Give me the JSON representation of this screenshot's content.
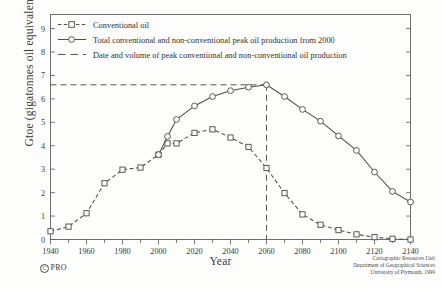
{
  "chart_data": {
    "type": "line",
    "title": "",
    "xlabel": "Year",
    "ylabel": "Gtoe (gigatonnes oil equivalent)",
    "xlim": [
      1940,
      2140
    ],
    "ylim": [
      0,
      9.6
    ],
    "xticks": [
      1940,
      1960,
      1980,
      2000,
      2020,
      2040,
      2060,
      2080,
      2100,
      2120,
      2140
    ],
    "xtick_labels": [
      "1940",
      "1960",
      "1980",
      "2000",
      "2020",
      "2040",
      "2060",
      "2080",
      "2100",
      "2120",
      "2140"
    ],
    "xminorticks": [
      1950,
      1970,
      1990,
      2010,
      2030,
      2050,
      2070,
      2090,
      2110,
      2130
    ],
    "yticks": [
      0,
      1,
      2,
      3,
      4,
      5,
      6,
      7,
      8,
      9
    ],
    "ytick_labels": [
      "0",
      "1",
      "2",
      "3",
      "4",
      "5",
      "6",
      "7",
      "8",
      "9"
    ],
    "grid": false,
    "legend_position": "upper-left-inside",
    "series": [
      {
        "name": "Conventional oil",
        "style": "dashed",
        "marker": "square",
        "x": [
          1940,
          1950,
          1960,
          1970,
          1980,
          1990,
          2000,
          2005,
          2010,
          2020,
          2030,
          2040,
          2050,
          2060,
          2070,
          2080,
          2090,
          2100,
          2110,
          2120,
          2130,
          2140
        ],
        "values": [
          0.35,
          0.55,
          1.12,
          2.4,
          2.98,
          3.07,
          3.62,
          4.1,
          4.1,
          4.55,
          4.7,
          4.35,
          3.95,
          3.05,
          1.98,
          1.07,
          0.63,
          0.4,
          0.22,
          0.1,
          0.03,
          0.0
        ]
      },
      {
        "name": "Total conventional and non-conventional peak oil production from 2000",
        "style": "solid",
        "marker": "circle",
        "x": [
          2000,
          2005,
          2010,
          2020,
          2030,
          2040,
          2050,
          2060,
          2070,
          2080,
          2090,
          2100,
          2110,
          2120,
          2130,
          2140
        ],
        "values": [
          3.62,
          4.4,
          5.12,
          5.7,
          6.1,
          6.35,
          6.5,
          6.6,
          6.1,
          5.55,
          5.05,
          4.42,
          3.8,
          2.88,
          2.05,
          1.6
        ]
      }
    ],
    "annotations": [
      {
        "name": "peak-guide",
        "label": "Date and volume of peak conventional and non-conventional oil production",
        "x": 2060,
        "y": 6.6,
        "style": "dashed"
      }
    ],
    "legend": [
      {
        "label": "Conventional oil",
        "style": "dashed",
        "marker": "square"
      },
      {
        "label": "Total conventional and non-conventional peak oil production from 2000",
        "style": "solid",
        "marker": "circle"
      },
      {
        "label": "Date and volume of peak conventional and non-conventional oil production",
        "style": "dashed",
        "marker": "none"
      }
    ]
  },
  "credits": {
    "line1": "Cartographic Resources Unit",
    "line2": "Department of Geographical Sciences",
    "line3": "University of Plymouth, 1999",
    "copyright_symbol": "C",
    "copyright_text": "PRO"
  }
}
